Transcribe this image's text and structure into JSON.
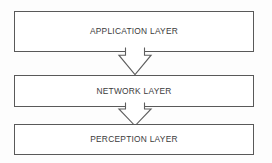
{
  "diagram": {
    "type": "layered-block-diagram",
    "orientation": "vertical-top-down",
    "background_color": "#fdfdfd",
    "box_fill_color": "#ffffff",
    "box_border_color": "#595959",
    "text_color": "#3b3b3b",
    "arrow_fill_color": "#ffffff",
    "arrow_border_color": "#5e5e5e",
    "layers": [
      {
        "id": "application",
        "label": "APPLICATION LAYER",
        "order": 1
      },
      {
        "id": "network",
        "label": "NETWORK LAYER",
        "order": 2
      },
      {
        "id": "perception",
        "label": "PERCEPTION LAYER",
        "order": 3
      }
    ],
    "connectors": [
      {
        "id": "application-to-network",
        "from": "application",
        "to": "network",
        "shape": "block-arrow",
        "direction": "down"
      },
      {
        "id": "network-to-perception",
        "from": "network",
        "to": "perception",
        "shape": "block-arrow",
        "direction": "down"
      }
    ]
  }
}
